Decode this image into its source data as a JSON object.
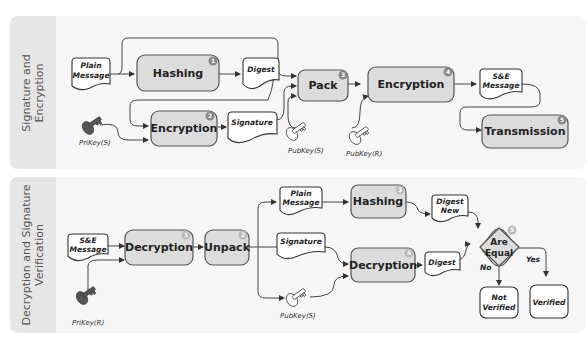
{
  "top_panel": {
    "label": "Signature and\nEncryption",
    "processes": [
      {
        "label": "Hashing",
        "step": "1"
      },
      {
        "label": "Encryption",
        "step": "2"
      },
      {
        "label": "Pack",
        "step": "3"
      },
      {
        "label": "Encryption",
        "step": "4"
      },
      {
        "label": "Transmission",
        "step": "5"
      }
    ],
    "documents": [
      {
        "line1": "Plain",
        "line2": "Message"
      },
      {
        "line1": "Digest",
        "line2": ""
      },
      {
        "line1": "Signature",
        "line2": ""
      },
      {
        "line1": "S&E",
        "line2": "Message"
      }
    ],
    "keys": [
      "PriKey(S)",
      "PubKey(S)",
      "PubKey(R)"
    ]
  },
  "bottom_panel": {
    "label": "Decryption and Signature\nVerification",
    "processes": [
      {
        "label": "Decryption",
        "step": "1"
      },
      {
        "label": "Unpack",
        "step": "2"
      },
      {
        "label": "Hashing",
        "step": "3"
      },
      {
        "label": "Decryption",
        "step": "4"
      }
    ],
    "decision": {
      "line1": "Are",
      "line2": "Equal",
      "step": "5",
      "yes": "Yes",
      "no": "No"
    },
    "documents": [
      {
        "line1": "S&E",
        "line2": "Message"
      },
      {
        "line1": "Plain",
        "line2": "Message"
      },
      {
        "line1": "Signature",
        "line2": ""
      },
      {
        "line1": "Digest",
        "line2": "New"
      },
      {
        "line1": "Digest",
        "line2": ""
      }
    ],
    "results": [
      {
        "line1": "Not",
        "line2": "Verified"
      },
      {
        "line1": "Verified",
        "line2": ""
      }
    ],
    "keys": [
      "PriKey(R)",
      "PubKey(S)"
    ]
  }
}
